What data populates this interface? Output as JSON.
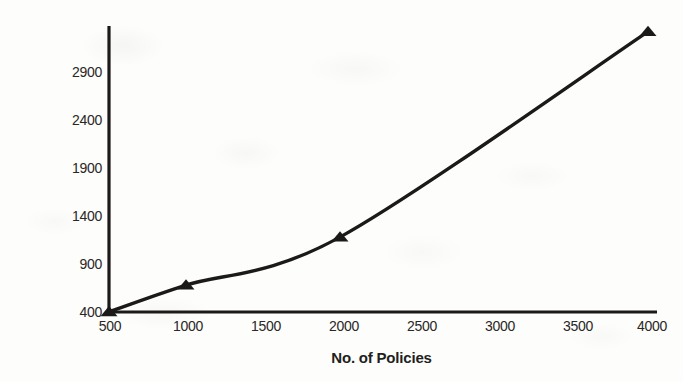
{
  "chart_data": {
    "type": "line",
    "title": "",
    "xlabel": "No. of Policies",
    "ylabel": "Time (in msec)",
    "x": [
      500,
      1000,
      2000,
      4000
    ],
    "values": [
      400,
      680,
      1180,
      3320
    ],
    "series": [
      {
        "name": "Time",
        "x": [
          500,
          1000,
          2000,
          4000
        ],
        "values": [
          400,
          680,
          1180,
          3320
        ]
      }
    ],
    "xlim": [
      500,
      4000
    ],
    "ylim": [
      400,
      3400
    ],
    "xticks": [
      500,
      1000,
      1500,
      2000,
      2500,
      3000,
      3500,
      4000
    ],
    "yticks": [
      400,
      900,
      1400,
      1900,
      2400,
      2900
    ],
    "xtick_labels": [
      "500",
      "1000",
      "1500",
      "2000",
      "2500",
      "3000",
      "3500",
      "4000"
    ],
    "ytick_labels": [
      "400",
      "900",
      "1400",
      "1900",
      "2400",
      "2900"
    ],
    "grid": false,
    "legend": false,
    "legend_position": "none",
    "marker": "triangle",
    "line_color": "#1c1a18",
    "marker_color": "#1c1a18",
    "axis_color": "#1c1a18",
    "background_color": "#fdfdfc",
    "smoothed": true
  }
}
